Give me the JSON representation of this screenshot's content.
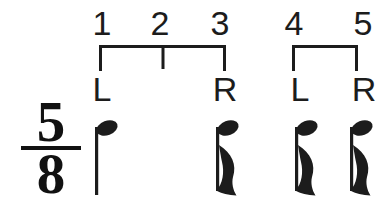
{
  "diagram": {
    "counts": [
      "1",
      "2",
      "3",
      "4",
      "5"
    ],
    "groups": [
      {
        "beats": "1-3",
        "left_label": "L",
        "right_label": "R"
      },
      {
        "beats": "4-5",
        "left_label": "L",
        "right_label": "R"
      }
    ],
    "time_signature": {
      "numerator": "5",
      "denominator": "8"
    },
    "notes": [
      {
        "beat": "1",
        "value": "quarter",
        "stem": "down"
      },
      {
        "beat": "3",
        "value": "eighth",
        "stem": "down"
      },
      {
        "beat": "4",
        "value": "eighth",
        "stem": "down"
      },
      {
        "beat": "5",
        "value": "eighth",
        "stem": "down"
      }
    ],
    "ink_color": "#1c1c1c",
    "background_color": "#ffffff"
  }
}
